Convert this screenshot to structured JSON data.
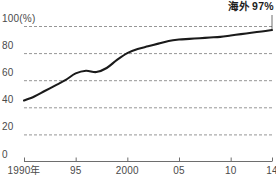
{
  "chart_data": {
    "type": "line",
    "title": "",
    "subtitle": "",
    "xlabel": "",
    "ylabel": "",
    "unit_label": "(%)",
    "grid": true,
    "legend_position": "none",
    "xlim": [
      1990,
      2014
    ],
    "ylim": [
      0,
      100
    ],
    "y_ticks": [
      0,
      20,
      40,
      60,
      80,
      100
    ],
    "y_tick_labels": [
      "0",
      "20",
      "40",
      "60",
      "80",
      "100"
    ],
    "x_ticks": [
      1990,
      1995,
      2000,
      2005,
      2010,
      2014
    ],
    "x_tick_labels": [
      "1990年",
      "95",
      "2000",
      "05",
      "10",
      "14"
    ],
    "annotations": [
      {
        "text": "海外 97%",
        "x": 2014,
        "y": 97,
        "position": "top-right"
      }
    ],
    "series": [
      {
        "name": "海外",
        "color": "#1a1a1a",
        "end_value": 97,
        "x": [
          1990,
          1991,
          1992,
          1993,
          1994,
          1995,
          1996,
          1997,
          1998,
          1999,
          2000,
          2001,
          2002,
          2003,
          2004,
          2005,
          2006,
          2007,
          2008,
          2009,
          2010,
          2011,
          2012,
          2013,
          2014
        ],
        "values": [
          45,
          48,
          52,
          56,
          60,
          65,
          67,
          66,
          69,
          75,
          80,
          83,
          85,
          87,
          89,
          90,
          90.5,
          91,
          91.5,
          92,
          93,
          94,
          95,
          96,
          97
        ]
      }
    ]
  },
  "axis": {
    "y_unit_suffix": "(%)"
  },
  "annotation": {
    "overseas_label": "海外 97%"
  }
}
